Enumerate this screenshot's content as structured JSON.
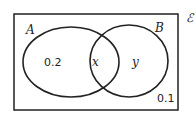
{
  "diagram": {
    "type": "venn",
    "universal_set_label": "ℰ",
    "sets": [
      {
        "name": "A",
        "label": "A"
      },
      {
        "name": "B",
        "label": "B"
      }
    ],
    "regions": {
      "A_only": "0.2",
      "A_and_B": "x",
      "B_only": "y",
      "outside": "0.1"
    }
  }
}
